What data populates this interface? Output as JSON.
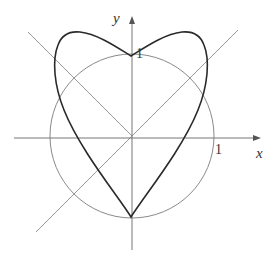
{
  "figure": {
    "axes": {
      "x_label": "x",
      "y_label": "y",
      "x_tick_label": "1",
      "y_tick_label": "1"
    },
    "elements": [
      {
        "name": "unit-circle",
        "description": "circle of radius 1 centered at origin"
      },
      {
        "name": "line-y-eq-x",
        "description": "line y = x"
      },
      {
        "name": "line-y-eq-neg-x",
        "description": "line y = -x"
      },
      {
        "name": "heart-curve",
        "description": "heart-shaped polar curve with cusp at (0,-1) and passing through (0,1)"
      }
    ],
    "colors": {
      "curve": "#2a2a2a",
      "guide": "#8a8a8a",
      "axis": "#666666"
    }
  }
}
